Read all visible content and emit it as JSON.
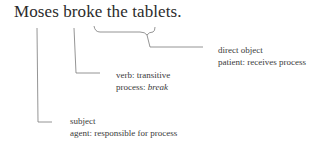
{
  "sentence": "Moses broke the tablets.",
  "annotations": {
    "object": {
      "line1": "direct object",
      "line2": "patient: receives process"
    },
    "verb": {
      "line1": "verb: transitive",
      "line2_prefix": "process: ",
      "line2_italic": "break"
    },
    "subject": {
      "line1": "subject",
      "line2": "agent: responsible for process"
    }
  },
  "colors": {
    "line": "#777777",
    "text": "#333333"
  }
}
